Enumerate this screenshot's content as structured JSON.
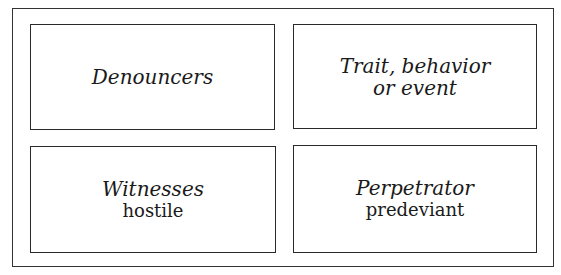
{
  "diagram": {
    "boxes": {
      "top_left": {
        "title": "Denouncers"
      },
      "top_right": {
        "title_line1": "Trait, behavior",
        "title_line2": "or event"
      },
      "bottom_left": {
        "title": "Witnesses",
        "subtitle": "hostile"
      },
      "bottom_right": {
        "title": "Perpetrator",
        "subtitle": "predeviant"
      }
    },
    "colors": {
      "border": "#2a2a2a",
      "text": "#1a1a1a",
      "background": "#ffffff"
    }
  }
}
